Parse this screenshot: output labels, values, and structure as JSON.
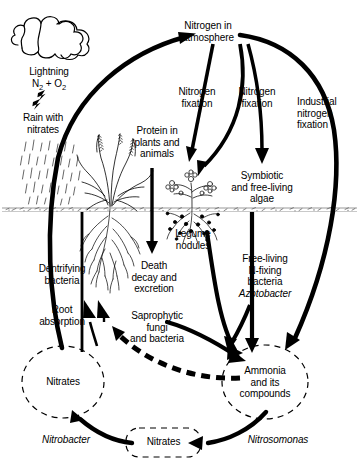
{
  "diagram": {
    "type": "cycle-diagram",
    "colors": {
      "ink": "#000000",
      "background": "#ffffff",
      "soil": "#888888"
    },
    "nodes": [
      {
        "id": "atmosphere",
        "label": "Nitrogen in\natmosphere",
        "shape": "text",
        "x": 208,
        "y": 30
      },
      {
        "id": "nitrates_left",
        "label": "Nitrates",
        "shape": "dashed-circle",
        "x": 63,
        "y": 382
      },
      {
        "id": "ammonia",
        "label": "Ammonia\nand its\ncompounds",
        "shape": "dashed-circle",
        "x": 265,
        "y": 382
      },
      {
        "id": "nitrates_bottom",
        "label": "Nitrates",
        "shape": "dashed-rounded",
        "x": 163,
        "y": 441
      }
    ],
    "labels": [
      {
        "id": "lightning",
        "text": "Lightning",
        "x": 48,
        "y": 72
      },
      {
        "id": "lightning_formula",
        "text": "N2 + O2",
        "x": 48,
        "y": 84
      },
      {
        "id": "rain",
        "text": "Rain with\nnitrates",
        "x": 42,
        "y": 118
      },
      {
        "id": "nitrogen_fix_1",
        "text": "Nitrogen\nfixation",
        "x": 197,
        "y": 92
      },
      {
        "id": "nitrogen_fix_2",
        "text": "Nitrogen\nfixation",
        "x": 255,
        "y": 92
      },
      {
        "id": "industrial_fix",
        "text": "Industrial\nnitrogen\nfixation",
        "x": 330,
        "y": 108
      },
      {
        "id": "protein",
        "text": "Protein in\nplants and\nanimals",
        "x": 157,
        "y": 137
      },
      {
        "id": "algae",
        "text": "Symbiotic\nand free-living\nalgae",
        "x": 262,
        "y": 183
      },
      {
        "id": "legume",
        "text": "Legume\nnodules",
        "x": 193,
        "y": 235
      },
      {
        "id": "denitrifying",
        "text": "Dentrifying\nbacteria",
        "x": 62,
        "y": 270
      },
      {
        "id": "death_decay",
        "text": "Death\ndecay and\nexcretion",
        "x": 153,
        "y": 272
      },
      {
        "id": "free_living",
        "text": "Free-living\nN-fixing\nbacteria",
        "x": 264,
        "y": 262
      },
      {
        "id": "azotobacter",
        "text": "Azotobacter",
        "x": 264,
        "y": 296,
        "italic": true
      },
      {
        "id": "root_absorption",
        "text": "Root\nabsorption",
        "x": 62,
        "y": 312
      },
      {
        "id": "saprophytic",
        "text": "Saprophytic\nfungi\nand bacteria",
        "x": 157,
        "y": 318
      },
      {
        "id": "nitrobacter",
        "text": "Nitrobacter",
        "x": 66,
        "y": 440,
        "italic": true
      },
      {
        "id": "nitrosomonas",
        "text": "Nitrosomonas",
        "x": 278,
        "y": 440,
        "italic": true
      }
    ],
    "illustrations": [
      {
        "id": "cloud",
        "description": "cloud-outline"
      },
      {
        "id": "lightning-bolt",
        "description": "lightning-bolt-glyph"
      },
      {
        "id": "rain-streaks",
        "description": "rain-streaks"
      },
      {
        "id": "soil-line",
        "description": "horizontal-soil-surface-band"
      },
      {
        "id": "grass-plant",
        "description": "grass-plant-with-roots"
      },
      {
        "id": "legume-plant",
        "description": "legume-plant-with-root-nodules"
      }
    ],
    "flows": [
      {
        "from": "nitrates_left",
        "to": "atmosphere",
        "via": "denitrifying",
        "style": "solid"
      },
      {
        "from": "atmosphere",
        "to": "protein",
        "via": "nitrogen_fix_1",
        "style": "solid"
      },
      {
        "from": "atmosphere",
        "to": "legume",
        "via": "nitrogen_fix_2",
        "style": "solid"
      },
      {
        "from": "atmosphere",
        "to": "ammonia",
        "via": "industrial_fix",
        "style": "solid"
      },
      {
        "from": "atmosphere",
        "to": "algae",
        "via": "nitrogen_fix_2",
        "style": "solid"
      },
      {
        "from": "protein",
        "to": "death_decay",
        "via": "",
        "style": "solid"
      },
      {
        "from": "death_decay",
        "to": "ammonia",
        "via": "saprophytic",
        "style": "solid"
      },
      {
        "from": "algae",
        "to": "ammonia",
        "via": "",
        "style": "solid"
      },
      {
        "from": "free_living",
        "to": "ammonia",
        "via": "",
        "style": "solid"
      },
      {
        "from": "legume",
        "to": "ammonia",
        "via": "",
        "style": "solid"
      },
      {
        "from": "ammonia",
        "to": "root_absorption",
        "via": "",
        "style": "dashed"
      },
      {
        "from": "ammonia",
        "to": "nitrates_bottom",
        "via": "nitrosomonas",
        "style": "solid"
      },
      {
        "from": "nitrates_bottom",
        "to": "nitrates_left",
        "via": "nitrobacter",
        "style": "solid"
      },
      {
        "from": "nitrates_left",
        "to": "root_absorption",
        "via": "",
        "style": "solid"
      },
      {
        "from": "rain",
        "to": "nitrates_left",
        "via": "",
        "style": "solid"
      }
    ]
  }
}
